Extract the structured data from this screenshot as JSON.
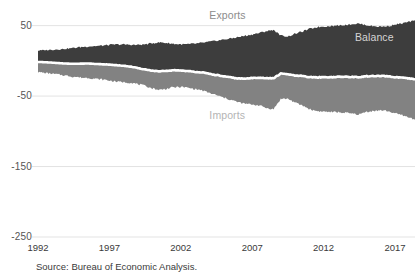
{
  "chart_data": {
    "type": "area",
    "title": "",
    "subtitle": "",
    "xlabel": "",
    "ylabel": "",
    "xlim": [
      1992,
      2018.4
    ],
    "ylim": [
      -250,
      75
    ],
    "grid": true,
    "gridlines_y": [
      50,
      -50,
      -150,
      -250
    ],
    "ytick_labels": [
      "50",
      "-50",
      "-150",
      "-250"
    ],
    "ytick_values": [
      50,
      -50,
      -150,
      -250
    ],
    "xtick_labels": [
      "1992",
      "1997",
      "2002",
      "2007",
      "2012",
      "2017"
    ],
    "xtick_values": [
      1992,
      1997,
      2002,
      2007,
      2012,
      2017
    ],
    "legend_position": "inline-annotations",
    "annotations": [
      {
        "name": "exports",
        "text": "Exports",
        "x": 2004.0,
        "y": 64
      },
      {
        "name": "imports",
        "text": "Imports",
        "x": 2004.0,
        "y": -78
      },
      {
        "name": "balance",
        "text": "Balance",
        "x": 2014.2,
        "y": 33
      }
    ],
    "colors": {
      "exports": "#3d3d3d",
      "imports": "#828282",
      "balance_line": "#ffffff",
      "gridline": "#e3e3e3",
      "axis_text": "#3a3a3a",
      "background": "#ffffff"
    },
    "series": [
      {
        "name": "Exports",
        "units": "billions of dollars, monthly",
        "color": "#3d3d3d",
        "x": [
          1992.0,
          1992.5,
          1993.0,
          1993.5,
          1994.0,
          1994.5,
          1995.0,
          1995.5,
          1996.0,
          1996.5,
          1997.0,
          1997.5,
          1998.0,
          1998.5,
          1999.0,
          1999.5,
          2000.0,
          2000.5,
          2001.0,
          2001.5,
          2002.0,
          2002.5,
          2003.0,
          2003.5,
          2004.0,
          2004.5,
          2005.0,
          2005.5,
          2006.0,
          2006.5,
          2007.0,
          2007.5,
          2008.0,
          2008.5,
          2009.0,
          2009.5,
          2010.0,
          2010.5,
          2011.0,
          2011.5,
          2012.0,
          2012.5,
          2013.0,
          2013.5,
          2014.0,
          2014.5,
          2015.0,
          2015.5,
          2016.0,
          2016.5,
          2017.0,
          2017.5,
          2018.0,
          2018.4
        ],
        "values": [
          14.5,
          15.2,
          15.8,
          16.3,
          17.2,
          18.4,
          19.6,
          20.4,
          21.0,
          21.6,
          22.6,
          23.4,
          23.2,
          22.8,
          22.6,
          23.4,
          25.0,
          26.2,
          25.4,
          24.0,
          23.4,
          23.6,
          24.4,
          25.6,
          27.0,
          28.6,
          30.2,
          31.8,
          33.6,
          35.6,
          37.4,
          39.6,
          42.2,
          44.0,
          35.8,
          34.6,
          38.4,
          41.6,
          45.2,
          47.8,
          48.8,
          49.4,
          50.2,
          51.0,
          52.2,
          52.8,
          50.6,
          49.2,
          48.6,
          49.2,
          51.4,
          53.0,
          55.4,
          56.8
        ]
      },
      {
        "name": "Imports",
        "units": "billions of dollars, monthly (plotted negative)",
        "color": "#828282",
        "x": [
          1992.0,
          1992.5,
          1993.0,
          1993.5,
          1994.0,
          1994.5,
          1995.0,
          1995.5,
          1996.0,
          1996.5,
          1997.0,
          1997.5,
          1998.0,
          1998.5,
          1999.0,
          1999.5,
          2000.0,
          2000.5,
          2001.0,
          2001.5,
          2002.0,
          2002.5,
          2003.0,
          2003.5,
          2004.0,
          2004.5,
          2005.0,
          2005.5,
          2006.0,
          2006.5,
          2007.0,
          2007.5,
          2008.0,
          2008.5,
          2009.0,
          2009.5,
          2010.0,
          2010.5,
          2011.0,
          2011.5,
          2012.0,
          2012.5,
          2013.0,
          2013.5,
          2014.0,
          2014.5,
          2015.0,
          2015.5,
          2016.0,
          2016.5,
          2017.0,
          2017.5,
          2018.0,
          2018.4
        ],
        "values": [
          -16.0,
          -17.2,
          -18.4,
          -19.6,
          -21.0,
          -22.6,
          -23.6,
          -24.2,
          -25.4,
          -26.4,
          -28.0,
          -29.6,
          -30.2,
          -31.0,
          -33.0,
          -35.6,
          -39.0,
          -41.2,
          -39.6,
          -37.4,
          -37.0,
          -38.2,
          -40.0,
          -42.0,
          -45.6,
          -48.8,
          -52.2,
          -55.4,
          -58.6,
          -61.0,
          -61.8,
          -63.2,
          -67.0,
          -68.6,
          -54.0,
          -53.6,
          -59.4,
          -63.2,
          -68.4,
          -71.2,
          -72.0,
          -72.6,
          -73.0,
          -73.6,
          -75.0,
          -76.0,
          -72.4,
          -71.0,
          -70.2,
          -71.2,
          -74.6,
          -77.0,
          -80.6,
          -83.0
        ]
      },
      {
        "name": "Balance",
        "units": "billions of dollars, monthly",
        "color": "#ffffff",
        "x": [
          1992.0,
          1992.5,
          1993.0,
          1993.5,
          1994.0,
          1994.5,
          1995.0,
          1995.5,
          1996.0,
          1996.5,
          1997.0,
          1997.5,
          1998.0,
          1998.5,
          1999.0,
          1999.5,
          2000.0,
          2000.5,
          2001.0,
          2001.5,
          2002.0,
          2002.5,
          2003.0,
          2003.5,
          2004.0,
          2004.5,
          2005.0,
          2005.5,
          2006.0,
          2006.5,
          2007.0,
          2007.5,
          2008.0,
          2008.5,
          2009.0,
          2009.5,
          2010.0,
          2010.5,
          2011.0,
          2011.5,
          2012.0,
          2012.5,
          2013.0,
          2013.5,
          2014.0,
          2014.5,
          2015.0,
          2015.5,
          2016.0,
          2016.5,
          2017.0,
          2017.5,
          2018.0,
          2018.4
        ],
        "values": [
          -1.5,
          -2.0,
          -2.6,
          -3.3,
          -3.8,
          -4.2,
          -4.0,
          -3.8,
          -4.4,
          -4.8,
          -5.4,
          -6.2,
          -7.0,
          -8.2,
          -10.4,
          -12.2,
          -14.0,
          -15.0,
          -14.2,
          -13.4,
          -13.6,
          -14.6,
          -15.6,
          -16.4,
          -18.6,
          -20.2,
          -22.0,
          -23.6,
          -25.0,
          -25.4,
          -24.4,
          -23.6,
          -24.8,
          -24.6,
          -18.2,
          -19.0,
          -21.0,
          -21.6,
          -23.2,
          -23.4,
          -23.2,
          -23.2,
          -22.8,
          -22.6,
          -22.8,
          -23.2,
          -21.8,
          -21.8,
          -21.6,
          -22.0,
          -23.2,
          -24.0,
          -25.2,
          -26.2
        ]
      }
    ]
  },
  "footer": {
    "source": "Source: Bureau of Economic Analysis."
  }
}
